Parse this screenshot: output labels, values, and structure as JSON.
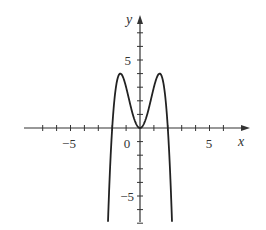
{
  "chart_data": {
    "type": "line",
    "title": "",
    "xlabel": "x",
    "ylabel": "y",
    "function": "y = -x^4 + 4x^2",
    "xlim": [
      -8,
      7.8
    ],
    "ylim": [
      -7,
      8
    ],
    "x_ticks": [
      -7,
      -6,
      -5,
      -4,
      -3,
      -2,
      -1,
      1,
      2,
      3,
      4,
      5,
      6
    ],
    "y_ticks": [
      -7,
      -6,
      -5,
      -4,
      -3,
      -2,
      -1,
      1,
      2,
      3,
      4,
      5,
      6,
      7
    ],
    "x_tick_labels": {
      "-5": "−5",
      "5": "5"
    },
    "y_tick_labels": {
      "5": "5",
      "-5": "−5"
    },
    "origin_label": "0",
    "grid": false,
    "legend": null,
    "key_points": [
      {
        "x": -2.3,
        "y": -7,
        "note": "curve exits bottom"
      },
      {
        "x": -2,
        "y": 0,
        "note": "x-intercept"
      },
      {
        "x": -1.41,
        "y": 4,
        "note": "local max"
      },
      {
        "x": 0,
        "y": 0,
        "note": "local min"
      },
      {
        "x": 1.41,
        "y": 4,
        "note": "local max"
      },
      {
        "x": 2,
        "y": 0,
        "note": "x-intercept"
      },
      {
        "x": 2.3,
        "y": -7,
        "note": "curve exits bottom"
      }
    ],
    "color": "#222222"
  },
  "labels": {
    "x_axis": "x",
    "y_axis": "y",
    "x_neg5": "−5",
    "x_pos5": "5",
    "origin": "0",
    "y_pos5": "5",
    "y_neg5": "−5"
  }
}
